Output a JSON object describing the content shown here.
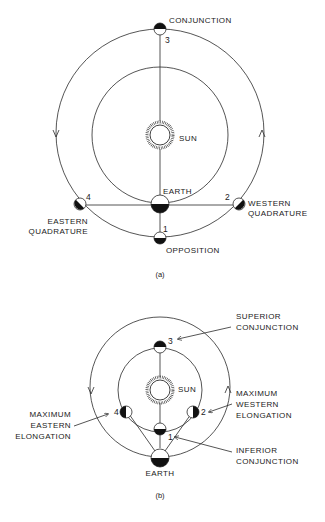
{
  "figure_a": {
    "caption": "(a)",
    "sun_label": "SUN",
    "earth_label": "EARTH",
    "positions": [
      {
        "number": "1",
        "label_lines": [
          "OPPOSITION"
        ]
      },
      {
        "number": "2",
        "label_lines": [
          "WESTERN",
          "QUADRATURE"
        ]
      },
      {
        "number": "3",
        "label_lines": [
          "CONJUNCTION"
        ]
      },
      {
        "number": "4",
        "label_lines": [
          "EASTERN",
          "QUADRATURE"
        ]
      }
    ]
  },
  "figure_b": {
    "caption": "(b)",
    "sun_label": "SUN",
    "earth_label": "EARTH",
    "positions": [
      {
        "number": "1",
        "label_lines": [
          "INFERIOR",
          "CONJUNCTION"
        ]
      },
      {
        "number": "2",
        "label_lines": [
          "MAXIMUM",
          "WESTERN",
          "ELONGATION"
        ]
      },
      {
        "number": "3",
        "label_lines": [
          "SUPERIOR",
          "CONJUNCTION"
        ]
      },
      {
        "number": "4",
        "label_lines": [
          "MAXIMUM",
          "EASTERN",
          "ELONGATION"
        ]
      }
    ]
  },
  "colors": {
    "ink": "#1a1a1a",
    "background": "#ffffff"
  }
}
